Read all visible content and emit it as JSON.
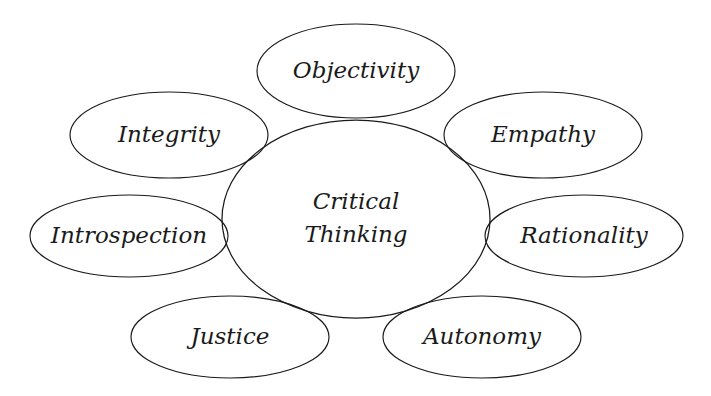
{
  "diagram": {
    "type": "hub-and-spoke-venn",
    "title": "Critical Thinking",
    "background_color": "#ffffff",
    "stroke_color": "#1a1a1a",
    "text_color": "#1a1a1a",
    "center": {
      "id": "critical-thinking",
      "label_line_1": "Critical",
      "label_line_2": "Thinking",
      "label": "Critical Thinking",
      "cx": 356,
      "cy": 219,
      "rx": 134,
      "ry": 99
    },
    "satellites": [
      {
        "id": "objectivity",
        "label": "Objectivity",
        "position": "top",
        "cx": 356,
        "cy": 71,
        "rx": 99,
        "ry": 47
      },
      {
        "id": "integrity",
        "label": "Integrity",
        "position": "top-left",
        "cx": 169,
        "cy": 135,
        "rx": 99,
        "ry": 43
      },
      {
        "id": "empathy",
        "label": "Empathy",
        "position": "top-right",
        "cx": 543,
        "cy": 135,
        "rx": 99,
        "ry": 43
      },
      {
        "id": "introspection",
        "label": "Introspection",
        "position": "left",
        "cx": 129,
        "cy": 236,
        "rx": 99,
        "ry": 41
      },
      {
        "id": "rationality",
        "label": "Rationality",
        "position": "right",
        "cx": 584,
        "cy": 236,
        "rx": 99,
        "ry": 41
      },
      {
        "id": "justice",
        "label": "Justice",
        "position": "bottom-left",
        "cx": 230,
        "cy": 337,
        "rx": 99,
        "ry": 41
      },
      {
        "id": "autonomy",
        "label": "Autonomy",
        "position": "bottom-right",
        "cx": 482,
        "cy": 337,
        "rx": 99,
        "ry": 41
      }
    ]
  }
}
